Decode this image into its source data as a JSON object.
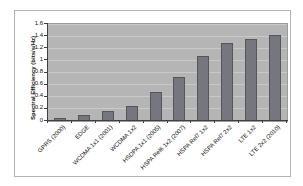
{
  "page": {
    "background": "#ffffff"
  },
  "chart_data": {
    "type": "bar",
    "title": "",
    "xlabel": "",
    "ylabel": "Spectral Efficiency (bits/s/Hz)",
    "categories": [
      "GPRS (2000)",
      "EDGE",
      "WCDMA 1x1 (2001)",
      "WCDMA 1x2",
      "HSDPA 1x1 (2005)",
      "HSPA Rel6 1x2 (2007)",
      "HSPA Rel7 1x2",
      "HSPA Rel7 2x2",
      "LTE 1x2",
      "LTE 2x2 (2010)"
    ],
    "values": [
      0.05,
      0.1,
      0.17,
      0.24,
      0.48,
      0.72,
      1.08,
      1.29,
      1.36,
      1.42
    ],
    "ylim": [
      0,
      1.6
    ],
    "yticks": [
      "0",
      "0.2",
      "0.4",
      "0.6",
      "0.8",
      "1",
      "1.2",
      "1.4",
      "1.6"
    ],
    "grid": "horizontal",
    "legend": "none",
    "x_label_rotation_deg": 45,
    "style": {
      "plot_background": "#b5b5b5",
      "gridline_color": "#c9c9c9",
      "bar_fill": "#76767e",
      "bar_border": "#55555c",
      "axis_color": "#404040",
      "frame_border": "#b3b3b3",
      "text_color": "#111111",
      "chart_background": "#ffffff"
    }
  }
}
